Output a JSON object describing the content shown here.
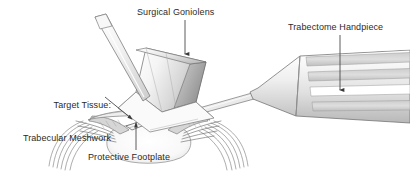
{
  "figure": {
    "background_color": "#ffffff",
    "text_color": "#2b2b2b",
    "width": 410,
    "height": 174
  },
  "labels": {
    "goniolens": "Surgical Goniolens",
    "handpiece": "Trabectome Handpiece",
    "target_line1": "Target Tissue:",
    "target_line2": "Trabecular Meshwork",
    "footplate": "Protective Footplate"
  },
  "parts": {
    "goniolens": "surgical-goniolens",
    "goniolens_handle": "goniolens-handle",
    "handpiece": "trabectome-handpiece",
    "handpiece_grip": "handpiece-ribbed-grip",
    "probe_shaft": "probe-shaft",
    "footplate": "protective-footplate",
    "eye": "eye-cross-section",
    "cornea": "cornea",
    "iris": "iris",
    "anterior_chamber": "anterior-chamber",
    "sclera": "sclera",
    "angle": "irido-corneal-angle"
  },
  "leaders": {
    "goniolens_arrow": "arrow-down",
    "handpiece_arrow": "arrow-down",
    "target_arrow": "arrow-down-right",
    "footplate_arrow": "arrow-up"
  },
  "colors": {
    "line": "#6e6e6e",
    "line_dark": "#3c3c3c",
    "fill_light": "#fbfbfb",
    "fill_mid": "#e2e2e2",
    "fill_shade": "#c9c9c9",
    "fill_dark": "#a9a9a9",
    "leader": "#555555"
  }
}
